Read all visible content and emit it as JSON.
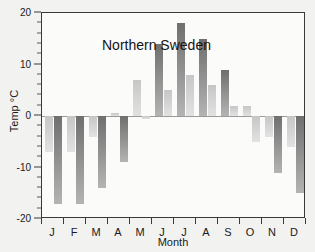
{
  "chart_data": {
    "type": "bar",
    "title": "Northern Sweden",
    "xlabel": "Month",
    "ylabel": "Temp °C",
    "ylim": [
      -20,
      20
    ],
    "yticks": [
      20,
      10,
      0,
      -10,
      -20
    ],
    "ytick_labels": [
      "20",
      "10",
      "0",
      "-10",
      "-20"
    ],
    "grid": false,
    "legend": "none",
    "categories": [
      "J",
      "F",
      "M",
      "A",
      "M",
      "J",
      "J",
      "A",
      "S",
      "O",
      "N",
      "D"
    ],
    "category_names": [
      "January",
      "February",
      "March",
      "April",
      "May",
      "June",
      "July",
      "August",
      "September",
      "October",
      "November",
      "December"
    ],
    "series": [
      {
        "name": "Series 1",
        "values": [
          -7,
          -7,
          -4,
          0.5,
          7,
          14,
          5,
          15,
          6,
          2,
          -5,
          -4
        ]
      },
      {
        "name": "Series 2",
        "values": [
          -17,
          -17,
          -14,
          -9,
          -0.5,
          18,
          8,
          9,
          2,
          -11,
          -6,
          -15
        ]
      }
    ],
    "bars": [
      {
        "month": "J",
        "series": 1,
        "value": -7
      },
      {
        "month": "J",
        "series": 2,
        "value": -17
      },
      {
        "month": "F",
        "series": 1,
        "value": -7
      },
      {
        "month": "F",
        "series": 2,
        "value": -17
      },
      {
        "month": "M",
        "series": 1,
        "value": -4
      },
      {
        "month": "M",
        "series": 2,
        "value": -14
      },
      {
        "month": "A",
        "series": 1,
        "value": 0.5
      },
      {
        "month": "A",
        "series": 2,
        "value": -9
      },
      {
        "month": "M",
        "series": 1,
        "value": 7
      },
      {
        "month": "M",
        "series": 2,
        "value": -0.5
      },
      {
        "month": "J",
        "series": 1,
        "value": 14
      },
      {
        "month": "J",
        "series": 2,
        "value": 5
      },
      {
        "month": "J",
        "series": 1,
        "value": 18
      },
      {
        "month": "J",
        "series": 2,
        "value": 8
      },
      {
        "month": "A",
        "series": 1,
        "value": 15
      },
      {
        "month": "A",
        "series": 2,
        "value": 6
      },
      {
        "month": "S",
        "series": 1,
        "value": 9
      },
      {
        "month": "S",
        "series": 2,
        "value": 2
      },
      {
        "month": "O",
        "series": 1,
        "value": 2
      },
      {
        "month": "O",
        "series": 2,
        "value": -5
      },
      {
        "month": "N",
        "series": 1,
        "value": -4
      },
      {
        "month": "N",
        "series": 2,
        "value": -11
      },
      {
        "month": "D",
        "series": 1,
        "value": -6
      },
      {
        "month": "D",
        "series": 2,
        "value": -15
      }
    ]
  },
  "colors": {
    "background": "#f2f2f0",
    "plot_background": "#fbfbfa",
    "axis": "#3a3a3a",
    "text": "#1a1a1a",
    "bar_dark": "#6f6f6f",
    "bar_light": "#cfcfcf",
    "zero_line": "#9a9a9a"
  }
}
